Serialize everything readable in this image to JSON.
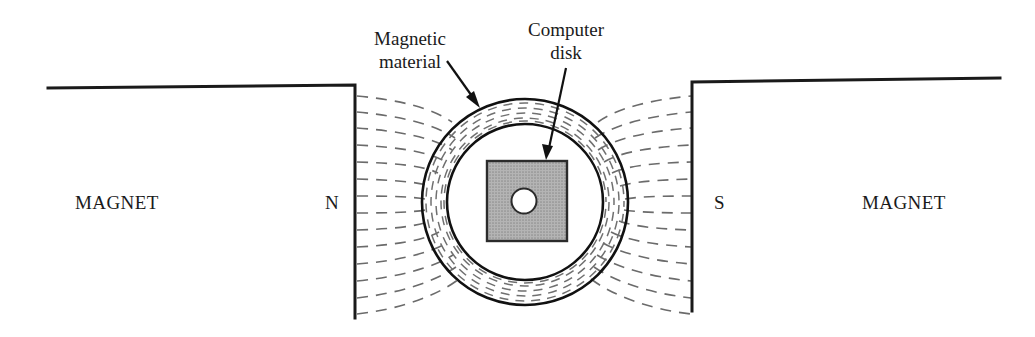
{
  "figure": {
    "background_color": "#ffffff",
    "width": 1035,
    "height": 337
  },
  "labels": {
    "magnetic_material_line1": "Magnetic",
    "magnetic_material_line2": "material",
    "computer_disk_line1": "Computer",
    "computer_disk_line2": "disk",
    "magnet_left": "MAGNET",
    "magnet_right": "MAGNET",
    "pole_north": "N",
    "pole_south": "S"
  },
  "colors": {
    "line": "#1a1a1a",
    "field_line": "#6b6b6b",
    "disk_fill": "#a8a8a8",
    "disk_stroke": "#2b2b2b",
    "ring_stroke": "#111111",
    "ring_hatch": "#707070",
    "hole_fill": "#ffffff"
  },
  "geometry": {
    "disk_center_x": 525,
    "disk_center_y": 202,
    "outer_radius": 103,
    "inner_radius": 78,
    "square_left": 487,
    "square_top": 161,
    "square_size": 80,
    "hole_radius": 12,
    "left_magnet_top_y": 87,
    "left_magnet_edge_x": 355,
    "left_magnet_bottom_y": 318,
    "right_magnet_top_y": 79,
    "right_magnet_edge_x": 692,
    "right_magnet_bottom_y": 311
  },
  "elements": {
    "left_magnet_name": "left magnet body with north pole face",
    "right_magnet_name": "right magnet body with south pole face",
    "field_region_left": "magnetic field lines entering disk from north pole",
    "field_region_right": "magnetic field lines leaving disk toward south pole",
    "annulus_name": "magnetic material ring",
    "square_name": "computer disk platter",
    "hole_name": "center spindle hole"
  }
}
